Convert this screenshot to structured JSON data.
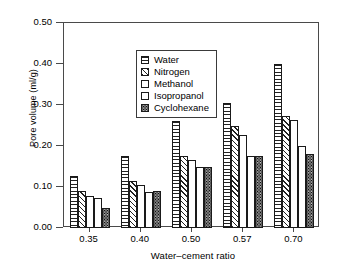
{
  "chart_data": {
    "type": "bar",
    "title": "",
    "xlabel": "Water–cement ratio",
    "ylabel": "Pore volume (ml/g)",
    "categories": [
      "0.35",
      "0.40",
      "0.50",
      "0.57",
      "0.70"
    ],
    "ylim": [
      0.0,
      0.5
    ],
    "yticks": [
      "0.00",
      "0.10",
      "0.20",
      "0.30",
      "0.40",
      "0.50"
    ],
    "ytick_values": [
      0.0,
      0.1,
      0.2,
      0.3,
      0.4,
      0.5
    ],
    "grid": false,
    "legend_position": "upper-left-inside",
    "series": [
      {
        "name": "Water",
        "pattern": "horizontal-lines",
        "values": [
          0.128,
          0.175,
          0.26,
          0.305,
          0.4
        ]
      },
      {
        "name": "Nitrogen",
        "pattern": "diagonal-hatch",
        "values": [
          0.09,
          0.115,
          0.176,
          0.248,
          0.272
        ]
      },
      {
        "name": "Methanol",
        "pattern": "empty",
        "values": [
          0.078,
          0.105,
          0.166,
          0.228,
          0.264
        ]
      },
      {
        "name": "Isopropanol",
        "pattern": "empty",
        "values": [
          0.073,
          0.088,
          0.15,
          0.175,
          0.2
        ]
      },
      {
        "name": "Cyclohexane",
        "pattern": "stipple",
        "values": [
          0.05,
          0.09,
          0.15,
          0.176,
          0.18
        ]
      }
    ]
  }
}
